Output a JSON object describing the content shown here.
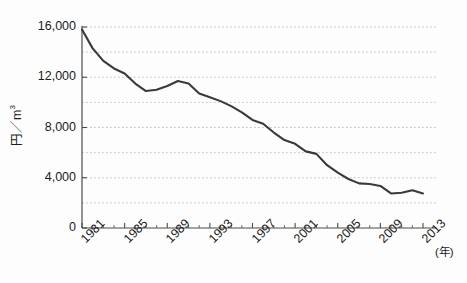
{
  "chart_data": {
    "type": "line",
    "title": "",
    "xlabel": "(年)",
    "ylabel": "円／m3",
    "ylabel_base": "円／m",
    "ylabel_sup": "3",
    "xunit_label": "(年)",
    "ylim": [
      0,
      16000
    ],
    "xlim": [
      1981,
      2013
    ],
    "grid": true,
    "grid_style": "dotted-horizontal",
    "legend": "none",
    "line_color": "#3a3a3a",
    "grid_color": "#b9b9b9",
    "axis_color": "#4a4a4a",
    "background_color": "#fdfdfd",
    "y_ticks": [
      0,
      4000,
      8000,
      12000,
      16000
    ],
    "y_tick_labels": [
      "0",
      "4,000",
      "8,000",
      "12,000",
      "16,000"
    ],
    "y_gridlines": [
      2000,
      4000,
      6000,
      8000,
      10000,
      12000,
      14000,
      16000
    ],
    "x_ticks": [
      1981,
      1985,
      1989,
      1993,
      1997,
      2001,
      2005,
      2009,
      2013
    ],
    "x_tick_labels": [
      "1981",
      "1985",
      "1989",
      "1993",
      "1997",
      "2001",
      "2005",
      "2009",
      "2013"
    ],
    "x_minor_tick_interval": 1,
    "categories": [
      1981,
      1982,
      1983,
      1984,
      1985,
      1986,
      1987,
      1988,
      1989,
      1990,
      1991,
      1992,
      1993,
      1994,
      1995,
      1996,
      1997,
      1998,
      1999,
      2000,
      2001,
      2002,
      2003,
      2004,
      2005,
      2006,
      2007,
      2008,
      2009,
      2010,
      2011,
      2012,
      2013
    ],
    "values": [
      15800,
      14300,
      13300,
      12700,
      12300,
      11500,
      10900,
      11000,
      11300,
      11700,
      11500,
      10700,
      10400,
      10100,
      9700,
      9200,
      8600,
      8300,
      7600,
      7000,
      6700,
      6100,
      5900,
      5000,
      4400,
      3900,
      3550,
      3500,
      3350,
      2750,
      2800,
      3000,
      2750
    ],
    "series": [
      {
        "name": "単価",
        "values": [
          15800,
          14300,
          13300,
          12700,
          12300,
          11500,
          10900,
          11000,
          11300,
          11700,
          11500,
          10700,
          10400,
          10100,
          9700,
          9200,
          8600,
          8300,
          7600,
          7000,
          6700,
          6100,
          5900,
          5000,
          4400,
          3900,
          3550,
          3500,
          3350,
          2750,
          2800,
          3000,
          2750
        ]
      }
    ]
  }
}
